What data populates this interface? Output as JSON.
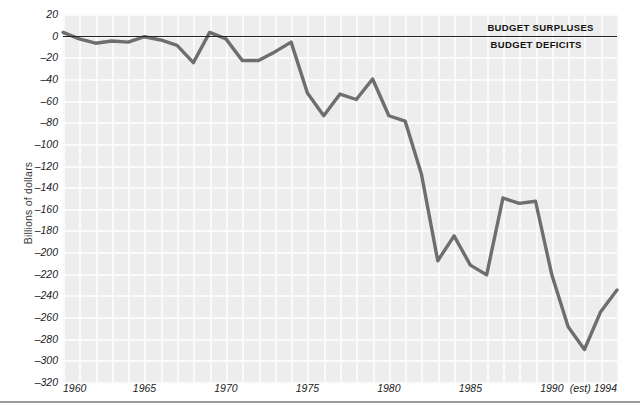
{
  "chart_data": {
    "type": "line",
    "title": "",
    "xlabel": "",
    "ylabel": "Billions of dollars",
    "xlim": [
      1960,
      1994
    ],
    "ylim": [
      -320,
      20
    ],
    "ytick_step": 20,
    "grid": true,
    "legend": "none",
    "x": [
      1960,
      1961,
      1962,
      1963,
      1964,
      1965,
      1966,
      1967,
      1968,
      1969,
      1970,
      1971,
      1972,
      1973,
      1974,
      1975,
      1976,
      1977,
      1978,
      1979,
      1980,
      1981,
      1982,
      1983,
      1984,
      1985,
      1986,
      1987,
      1988,
      1989,
      1990,
      1991,
      1992,
      1993,
      1994
    ],
    "values": [
      3,
      -3,
      -7,
      -5,
      -6,
      -1,
      -4,
      -9,
      -25,
      3,
      -3,
      -23,
      -23,
      -15,
      -6,
      -53,
      -74,
      -54,
      -59,
      -40,
      -74,
      -79,
      -128,
      -208,
      -185,
      -212,
      -221,
      -150,
      -155,
      -153,
      -221,
      -269,
      -290,
      -255,
      -235
    ],
    "categories": [
      "1960",
      "1961",
      "1962",
      "1963",
      "1964",
      "1965",
      "1966",
      "1967",
      "1968",
      "1969",
      "1970",
      "1971",
      "1972",
      "1973",
      "1974",
      "1975",
      "1976",
      "1977",
      "1978",
      "1979",
      "1980",
      "1981",
      "1982",
      "1983",
      "1984",
      "1985",
      "1986",
      "1987",
      "1988",
      "1989",
      "1990",
      "1991",
      "1992",
      "1993",
      "1994"
    ],
    "series": [
      {
        "name": "Federal budget surplus/deficit",
        "color": "#6e6e6e",
        "values": [
          3,
          -3,
          -7,
          -5,
          -6,
          -1,
          -4,
          -9,
          -25,
          3,
          -3,
          -23,
          -23,
          -15,
          -6,
          -53,
          -74,
          -54,
          -59,
          -40,
          -74,
          -79,
          -128,
          -208,
          -185,
          -212,
          -221,
          -150,
          -155,
          -153,
          -221,
          -269,
          -290,
          -255,
          -235
        ]
      }
    ],
    "y_tick_labels": [
      "20",
      "0",
      "–20",
      "–40",
      "–60",
      "–80",
      "–100",
      "–120",
      "–140",
      "–160",
      "–180",
      "–200",
      "–220",
      "–240",
      "–260",
      "–280",
      "–300",
      "–320"
    ],
    "y_tick_values": [
      20,
      0,
      -20,
      -40,
      -60,
      -80,
      -100,
      -120,
      -140,
      -160,
      -180,
      -200,
      -220,
      -240,
      -260,
      -280,
      -300,
      -320
    ],
    "x_tick_labels": [
      "1960",
      "1965",
      "1970",
      "1975",
      "1980",
      "1985",
      "1990",
      "(est) 1994"
    ],
    "x_tick_values": [
      1960,
      1965,
      1970,
      1975,
      1980,
      1985,
      1990,
      1994
    ],
    "annotations": [
      {
        "text": "BUDGET SURPLUSES",
        "x": 1990,
        "y": 10,
        "position": "above-zero-line"
      },
      {
        "text": "BUDGET DEFICITS",
        "x": 1990,
        "y": -10,
        "position": "below-zero-line"
      }
    ],
    "colors": {
      "plot_background": "#ededed",
      "gridline": "#fafafa",
      "series_line": "#6e6e6e",
      "zero_line": "#222222",
      "axis_rule": "#9a9a9a",
      "tick_text": "#1c1c1c",
      "annotation_text": "#111111"
    }
  },
  "axis": {
    "y_title": "Billions of dollars"
  }
}
